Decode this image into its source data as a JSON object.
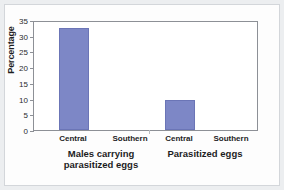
{
  "chart_data": {
    "type": "bar",
    "title": "",
    "xlabel": "",
    "ylabel": "Percentage",
    "ylim": [
      0,
      35
    ],
    "ytick_values": [
      0,
      5,
      10,
      15,
      20,
      25,
      30,
      35
    ],
    "ytick_labels": [
      "0",
      "5",
      "10",
      "15",
      "20",
      "25",
      "30",
      "35"
    ],
    "grid": false,
    "legend": "none",
    "groups": [
      {
        "label": "Males carrying\nparasitized eggs",
        "label_line1": "Males carrying",
        "label_line2": "parasitized eggs",
        "categories": [
          "Central",
          "Southern"
        ],
        "values": [
          32.5,
          0
        ]
      },
      {
        "label": "Parasitized eggs",
        "label_line1": "Parasitized eggs",
        "label_line2": "",
        "categories": [
          "Central",
          "Southern"
        ],
        "values": [
          9.5,
          0
        ]
      }
    ],
    "categories": [
      "Central",
      "Southern",
      "Central",
      "Southern"
    ],
    "values": [
      32.5,
      0,
      9.5,
      0
    ],
    "bar_color": "#7d87c6",
    "axis_color": "#8d9096",
    "plot_background": "#ffffff",
    "figure_background": "#eceef0"
  }
}
